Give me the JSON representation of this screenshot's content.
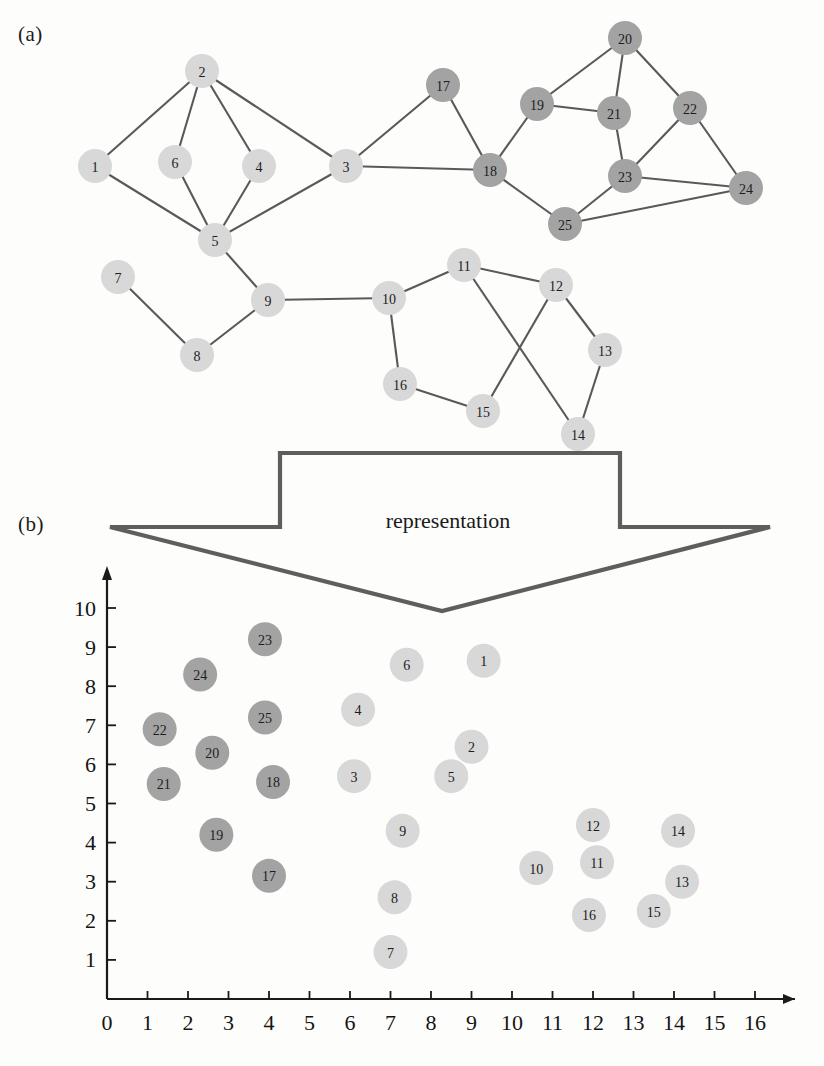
{
  "figure": {
    "panel_a_label": "(a)",
    "panel_b_label": "(b)",
    "arrow_label": "representation"
  },
  "colors": {
    "node_light": "#d8d8d8",
    "node_dark": "#a3a3a3",
    "edge": "#595959",
    "axis": "#1a1a1a",
    "arrow": "#5e5e5e",
    "background": "#fdfdfc"
  },
  "chart_data": [
    {
      "type": "diagram",
      "name": "graph-panel-a",
      "title": "(a)",
      "description": "Undirected graph with 25 labeled vertices, two shades of vertex fill",
      "nodes": [
        {
          "id": "1",
          "x": 95,
          "y": 166,
          "group": "light"
        },
        {
          "id": "2",
          "x": 202,
          "y": 71,
          "group": "light"
        },
        {
          "id": "3",
          "x": 346,
          "y": 166,
          "group": "light"
        },
        {
          "id": "4",
          "x": 259,
          "y": 166,
          "group": "light"
        },
        {
          "id": "5",
          "x": 215,
          "y": 240,
          "group": "light"
        },
        {
          "id": "6",
          "x": 175,
          "y": 162,
          "group": "light"
        },
        {
          "id": "7",
          "x": 118,
          "y": 277,
          "group": "light"
        },
        {
          "id": "8",
          "x": 197,
          "y": 355,
          "group": "light"
        },
        {
          "id": "9",
          "x": 268,
          "y": 300,
          "group": "light"
        },
        {
          "id": "10",
          "x": 389,
          "y": 298,
          "group": "light"
        },
        {
          "id": "11",
          "x": 464,
          "y": 265,
          "group": "light"
        },
        {
          "id": "12",
          "x": 556,
          "y": 285,
          "group": "light"
        },
        {
          "id": "13",
          "x": 605,
          "y": 350,
          "group": "light"
        },
        {
          "id": "14",
          "x": 578,
          "y": 434,
          "group": "light"
        },
        {
          "id": "15",
          "x": 483,
          "y": 411,
          "group": "light"
        },
        {
          "id": "16",
          "x": 400,
          "y": 384,
          "group": "light"
        },
        {
          "id": "17",
          "x": 443,
          "y": 85,
          "group": "dark"
        },
        {
          "id": "18",
          "x": 490,
          "y": 170,
          "group": "dark"
        },
        {
          "id": "19",
          "x": 537,
          "y": 104,
          "group": "dark"
        },
        {
          "id": "20",
          "x": 625,
          "y": 38,
          "group": "dark"
        },
        {
          "id": "21",
          "x": 614,
          "y": 113,
          "group": "dark"
        },
        {
          "id": "22",
          "x": 690,
          "y": 108,
          "group": "dark"
        },
        {
          "id": "23",
          "x": 625,
          "y": 176,
          "group": "dark"
        },
        {
          "id": "24",
          "x": 746,
          "y": 188,
          "group": "dark"
        },
        {
          "id": "25",
          "x": 565,
          "y": 224,
          "group": "dark"
        }
      ],
      "edges": [
        [
          "1",
          "2"
        ],
        [
          "1",
          "5"
        ],
        [
          "2",
          "6"
        ],
        [
          "2",
          "4"
        ],
        [
          "2",
          "3"
        ],
        [
          "6",
          "5"
        ],
        [
          "4",
          "5"
        ],
        [
          "3",
          "5"
        ],
        [
          "3",
          "17"
        ],
        [
          "3",
          "18"
        ],
        [
          "17",
          "18"
        ],
        [
          "5",
          "9"
        ],
        [
          "7",
          "8"
        ],
        [
          "8",
          "9"
        ],
        [
          "9",
          "10"
        ],
        [
          "10",
          "11"
        ],
        [
          "10",
          "16"
        ],
        [
          "11",
          "12"
        ],
        [
          "11",
          "14"
        ],
        [
          "12",
          "13"
        ],
        [
          "12",
          "15"
        ],
        [
          "13",
          "14"
        ],
        [
          "15",
          "16"
        ],
        [
          "18",
          "19"
        ],
        [
          "18",
          "25"
        ],
        [
          "19",
          "20"
        ],
        [
          "19",
          "21"
        ],
        [
          "20",
          "21"
        ],
        [
          "20",
          "22"
        ],
        [
          "21",
          "23"
        ],
        [
          "22",
          "23"
        ],
        [
          "22",
          "24"
        ],
        [
          "23",
          "24"
        ],
        [
          "23",
          "25"
        ],
        [
          "24",
          "25"
        ]
      ]
    },
    {
      "type": "scatter",
      "name": "embedding-panel-b",
      "title": "(b)",
      "xlabel": "",
      "ylabel": "",
      "xlim": [
        0,
        16
      ],
      "ylim": [
        0,
        10.6
      ],
      "xticks": [
        0,
        1,
        2,
        3,
        4,
        5,
        6,
        7,
        8,
        9,
        10,
        11,
        12,
        13,
        14,
        15,
        16
      ],
      "yticks": [
        1,
        2,
        3,
        4,
        5,
        6,
        7,
        8,
        9,
        10
      ],
      "grid": false,
      "legend": null,
      "points": [
        {
          "label": "1",
          "x": 9.3,
          "y": 8.65,
          "group": "light"
        },
        {
          "label": "2",
          "x": 9.0,
          "y": 6.45,
          "group": "light"
        },
        {
          "label": "3",
          "x": 6.1,
          "y": 5.7,
          "group": "light"
        },
        {
          "label": "4",
          "x": 6.2,
          "y": 7.4,
          "group": "light"
        },
        {
          "label": "5",
          "x": 8.5,
          "y": 5.7,
          "group": "light"
        },
        {
          "label": "6",
          "x": 7.4,
          "y": 8.55,
          "group": "light"
        },
        {
          "label": "7",
          "x": 7.0,
          "y": 1.2,
          "group": "light"
        },
        {
          "label": "8",
          "x": 7.1,
          "y": 2.6,
          "group": "light"
        },
        {
          "label": "9",
          "x": 7.3,
          "y": 4.3,
          "group": "light"
        },
        {
          "label": "10",
          "x": 10.6,
          "y": 3.35,
          "group": "light"
        },
        {
          "label": "11",
          "x": 12.1,
          "y": 3.5,
          "group": "light"
        },
        {
          "label": "12",
          "x": 12.0,
          "y": 4.45,
          "group": "light"
        },
        {
          "label": "13",
          "x": 14.2,
          "y": 3.0,
          "group": "light"
        },
        {
          "label": "14",
          "x": 14.1,
          "y": 4.3,
          "group": "light"
        },
        {
          "label": "15",
          "x": 13.5,
          "y": 2.25,
          "group": "light"
        },
        {
          "label": "16",
          "x": 11.9,
          "y": 2.15,
          "group": "light"
        },
        {
          "label": "17",
          "x": 4.0,
          "y": 3.15,
          "group": "dark"
        },
        {
          "label": "18",
          "x": 4.1,
          "y": 5.55,
          "group": "dark"
        },
        {
          "label": "19",
          "x": 2.7,
          "y": 4.2,
          "group": "dark"
        },
        {
          "label": "20",
          "x": 2.6,
          "y": 6.3,
          "group": "dark"
        },
        {
          "label": "21",
          "x": 1.4,
          "y": 5.5,
          "group": "dark"
        },
        {
          "label": "22",
          "x": 1.3,
          "y": 6.9,
          "group": "dark"
        },
        {
          "label": "23",
          "x": 3.9,
          "y": 9.2,
          "group": "dark"
        },
        {
          "label": "24",
          "x": 2.3,
          "y": 8.3,
          "group": "dark"
        },
        {
          "label": "25",
          "x": 3.9,
          "y": 7.2,
          "group": "dark"
        }
      ]
    }
  ]
}
